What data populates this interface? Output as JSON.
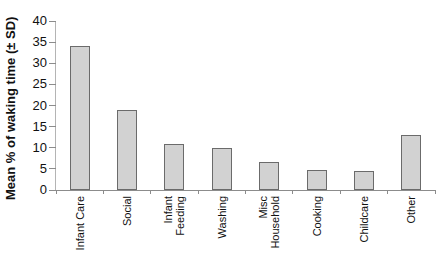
{
  "chart_data": {
    "type": "bar",
    "title": "",
    "ylabel": "Mean % of waking time (± SD)",
    "xlabel": "",
    "categories": [
      "Infant Care",
      "Social",
      "Infant\nFeeding",
      "Washing",
      "Misc\nHousehold",
      "Cooking",
      "Childcare",
      "Other"
    ],
    "values": [
      34,
      19,
      11,
      10,
      6.7,
      4.8,
      4.4,
      13
    ],
    "ylim": [
      0,
      40
    ],
    "ytick_step": 5,
    "ytick_labels": [
      "0",
      "5",
      "10",
      "15",
      "20",
      "25",
      "30",
      "35",
      "40"
    ],
    "grid": false,
    "legend": false,
    "error_bars_shown": false,
    "colors": {
      "bar_fill": "#d2d2d2",
      "bar_border": "#6b6b6b",
      "axis": "#8c8c8c",
      "axis_left": "#b4b4b4",
      "text": "#111111"
    }
  }
}
